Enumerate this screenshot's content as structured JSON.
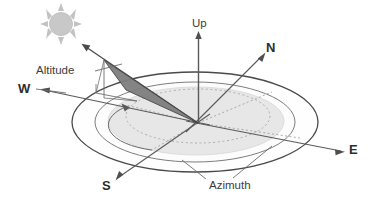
{
  "diagram": {
    "labels": {
      "up": "Up",
      "north": "N",
      "south": "S",
      "east": "E",
      "west": "W",
      "altitude": "Altitude",
      "azimuth": "Azimuth"
    },
    "icons": {
      "sun": "sun-icon"
    },
    "colors": {
      "background": "#ffffff",
      "outline": "#4a4a4a",
      "axis": "#555555",
      "wedge_fill": "#7f7f7f",
      "wedge_stroke": "#3f3f3f",
      "disk_fill": "#e6e6e6",
      "ring_fill": "#fdfdfd",
      "dotted": "#9a9a9a",
      "sun_fill": "#c9c9c9",
      "text": "#3b3b3b"
    },
    "geometry": {
      "origin": {
        "x": 198,
        "y": 123
      },
      "outer_ellipse": {
        "cx": 195,
        "cy": 122,
        "rx": 123,
        "ry": 50
      },
      "inner_ellipse": {
        "cx": 195,
        "cy": 122,
        "rx": 100,
        "ry": 40
      },
      "disk_ellipse": {
        "cx": 196,
        "cy": 121,
        "rx": 88,
        "ry": 34
      },
      "dotted_ellipse": {
        "cx": 198,
        "cy": 116,
        "rx": 72,
        "ry": 27
      },
      "up_axis": {
        "x1": 198,
        "y1": 123,
        "x2": 199,
        "y2": 33
      },
      "north_axis": {
        "x1": 198,
        "y1": 123,
        "x2": 265,
        "y2": 55
      },
      "south_axis": {
        "x1": 198,
        "y1": 123,
        "x2": 117,
        "y2": 178
      },
      "east_axis": {
        "x1": 198,
        "y1": 123,
        "x2": 344,
        "y2": 152
      },
      "west_axis": {
        "x1": 198,
        "y1": 123,
        "x2": 40,
        "y2": 90
      },
      "sun_ray": {
        "x1": 198,
        "y1": 123,
        "x2": 83,
        "y2": 45
      },
      "sun_center": {
        "x": 61,
        "y": 24,
        "r": 11
      }
    }
  }
}
